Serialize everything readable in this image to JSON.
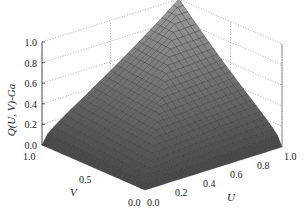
{
  "chart_data": {
    "type": "surface3d",
    "title": "",
    "zlabel": "Q(U, V)-Ga",
    "xlabel": "U",
    "ylabel": "V",
    "x_ticks": [
      "0.0",
      "0.2",
      "0.4",
      "0.6",
      "0.8",
      "1.0"
    ],
    "y_ticks": [
      "0.0",
      "0.5",
      "1.0"
    ],
    "z_ticks": [
      "0.0",
      "0.2",
      "0.4",
      "0.6",
      "0.8",
      "1.0"
    ],
    "xlim": [
      0,
      1
    ],
    "ylim": [
      0,
      1
    ],
    "zlim": [
      0,
      1
    ],
    "grid": true,
    "grid_style": "dotted",
    "surface_color": "#7a7a7a",
    "mesh_color": "#2a2a2a",
    "mesh_resolution": 24,
    "corner_values": [
      {
        "U": 0,
        "V": 0,
        "Q": 0.0
      },
      {
        "U": 1,
        "V": 0,
        "Q": 0.0
      },
      {
        "U": 0,
        "V": 1,
        "Q": 0.0
      },
      {
        "U": 1,
        "V": 1,
        "Q": 1.0
      }
    ]
  }
}
